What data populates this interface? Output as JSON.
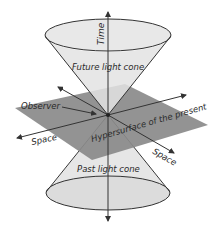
{
  "labels": {
    "time": "Time",
    "future_cone": "Future light cone",
    "past_cone": "Past light cone",
    "observer": "Observer",
    "space_left": "Space",
    "space_right": "Space",
    "hypersurface": "Hypersurface of the present"
  },
  "colors": {
    "cone_fill": "#e6e6e6",
    "plane_fill": "#8a8a8a",
    "line": "#333333",
    "background": "#ffffff"
  }
}
